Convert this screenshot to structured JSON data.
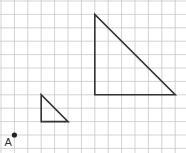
{
  "diagram": {
    "grid": {
      "cell_size_px": 13.4,
      "origin_px": [
        1,
        1
      ],
      "columns": 14,
      "rows": 11,
      "line_color": "#c8c8c8",
      "background": "#ffffff"
    },
    "point": {
      "label": "A",
      "grid_coords": [
        1,
        10
      ],
      "color": "#222222"
    },
    "shapes": [
      {
        "name": "small-triangle",
        "grid_vertices": [
          [
            3,
            7
          ],
          [
            3,
            9
          ],
          [
            5,
            9
          ]
        ],
        "stroke": "#333333"
      },
      {
        "name": "large-triangle",
        "grid_vertices": [
          [
            7,
            1
          ],
          [
            7,
            7
          ],
          [
            13,
            7
          ]
        ],
        "stroke": "#333333"
      }
    ]
  }
}
